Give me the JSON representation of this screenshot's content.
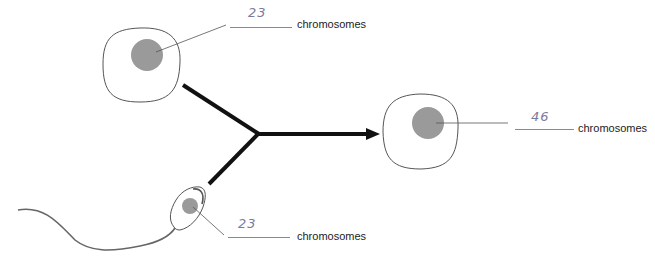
{
  "diagram": {
    "colors": {
      "cell_outline": "#555555",
      "nucleus_fill": "#9a9a9a",
      "arrow": "#111111",
      "leader_line": "#555555",
      "answer_ink": "#7a7aa0"
    },
    "cells": [
      {
        "id": "egg",
        "answer": "23",
        "label": "chromosomes"
      },
      {
        "id": "sperm",
        "answer": "23",
        "label": "chromosomes"
      },
      {
        "id": "zygote",
        "answer": "46",
        "label": "chromosomes"
      }
    ]
  }
}
